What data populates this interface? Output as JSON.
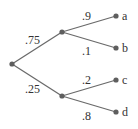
{
  "diagram": {
    "type": "probability-tree",
    "nodes": [
      {
        "id": "root",
        "label": ""
      },
      {
        "id": "n1",
        "label": ""
      },
      {
        "id": "n2",
        "label": ""
      },
      {
        "id": "a",
        "label": "a"
      },
      {
        "id": "b",
        "label": "b"
      },
      {
        "id": "c",
        "label": "c"
      },
      {
        "id": "d",
        "label": "d"
      }
    ],
    "edges": [
      {
        "from": "root",
        "to": "n1",
        "prob": ".75"
      },
      {
        "from": "root",
        "to": "n2",
        "prob": ".25"
      },
      {
        "from": "n1",
        "to": "a",
        "prob": ".9"
      },
      {
        "from": "n1",
        "to": "b",
        "prob": ".1"
      },
      {
        "from": "n2",
        "to": "c",
        "prob": ".2"
      },
      {
        "from": "n2",
        "to": "d",
        "prob": ".8"
      }
    ]
  }
}
